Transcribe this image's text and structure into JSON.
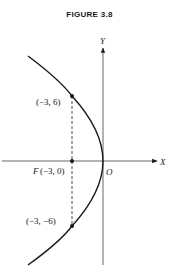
{
  "figure": {
    "title": "FIGURE 3.8"
  },
  "axes": {
    "x_label": "X",
    "y_label": "Y",
    "origin_label": "O"
  },
  "curve": {
    "type": "parabola",
    "equation": "y^2 = -12x",
    "opens": "left",
    "vertex": [
      0,
      0
    ]
  },
  "points": [
    {
      "name": "latus-top",
      "label": "(−3, 6)",
      "x": -3,
      "y": 6
    },
    {
      "name": "focus",
      "label_prefix": "F",
      "label": "(−3, 0)",
      "x": -3,
      "y": 0
    },
    {
      "name": "latus-bottom",
      "label": "(−3, −6)",
      "x": -3,
      "y": -6
    }
  ],
  "colors": {
    "ink": "#1a1a1a",
    "axis": "#555555"
  }
}
